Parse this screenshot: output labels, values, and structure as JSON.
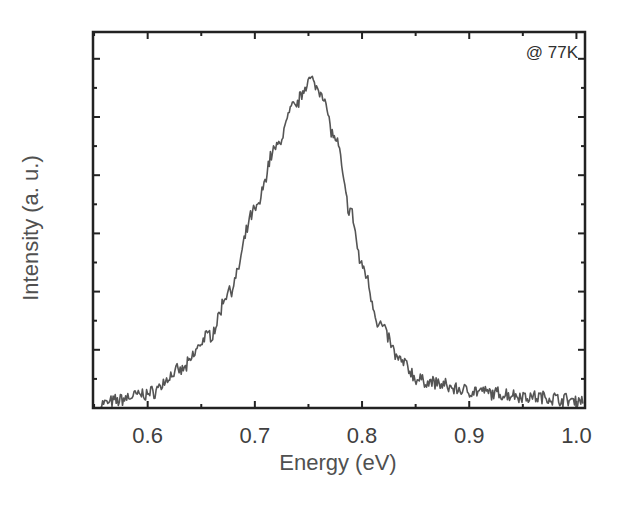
{
  "chart_data": {
    "type": "line",
    "title": "",
    "xlabel": "Energy (eV)",
    "ylabel": "Intensity (a. u.)",
    "xlim": [
      0.549,
      1.008
    ],
    "ylim": [
      0,
      1.12
    ],
    "x_ticks": [
      0.6,
      0.7,
      0.8,
      0.9,
      1.0
    ],
    "x_tick_labels": [
      "0.6",
      "0.7",
      "0.8",
      "0.9",
      "1.0"
    ],
    "y_tick_labels": [],
    "y_major_ticks": 6,
    "grid": false,
    "legend": null,
    "annotations": [
      {
        "text": "@ 77K",
        "position": "top-right"
      }
    ],
    "series": [
      {
        "name": "PL spectrum @ 77K",
        "color": "#555555",
        "x": [
          0.555,
          0.6,
          0.63,
          0.658,
          0.677,
          0.7,
          0.719,
          0.737,
          0.751,
          0.761,
          0.775,
          0.789,
          0.8,
          0.817,
          0.836,
          0.854,
          0.9,
          0.929,
          0.966,
          1.0
        ],
        "values": [
          0.01,
          0.04,
          0.11,
          0.22,
          0.36,
          0.6,
          0.79,
          0.92,
          1.0,
          0.97,
          0.82,
          0.6,
          0.43,
          0.25,
          0.14,
          0.08,
          0.05,
          0.04,
          0.03,
          0.02
        ]
      }
    ]
  },
  "labels": {
    "xlabel": "Energy (eV)",
    "ylabel": "Intensity (a. u.)",
    "annotation": "@ 77K",
    "x_ticks": [
      "0.6",
      "0.7",
      "0.8",
      "0.9",
      "1.0"
    ]
  }
}
